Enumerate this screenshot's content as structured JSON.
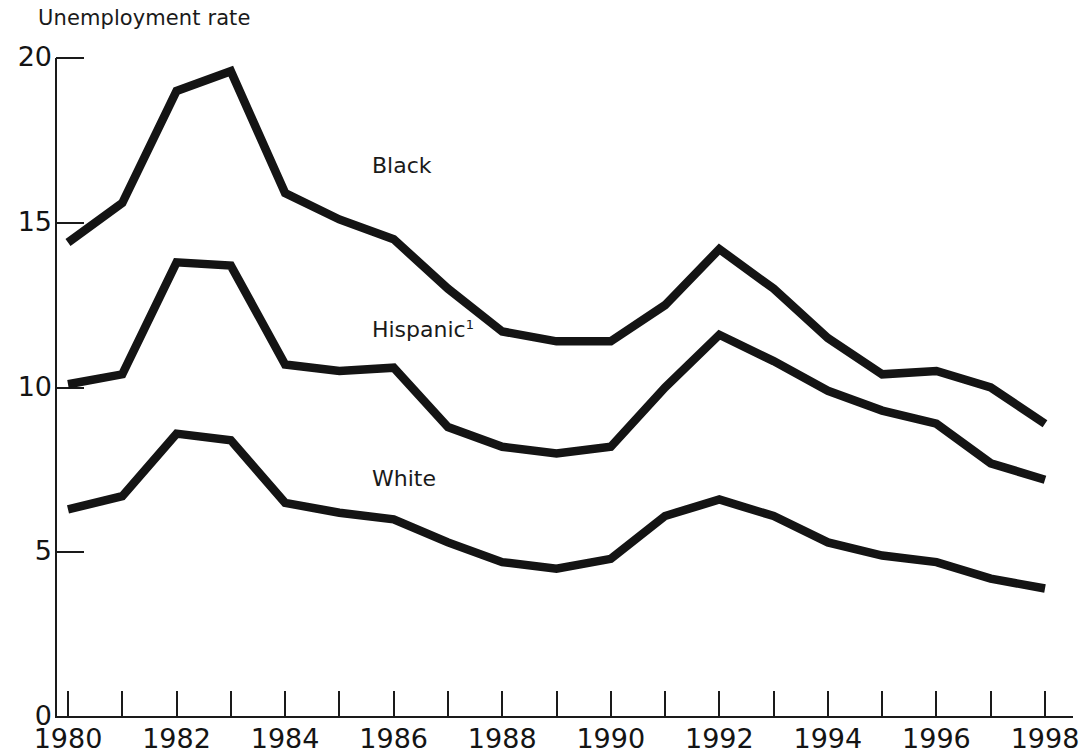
{
  "chart_data": {
    "type": "line",
    "title": "Unemployment rate",
    "xlabel": "",
    "ylabel": "",
    "xlim": [
      1980,
      1998
    ],
    "ylim": [
      0,
      20
    ],
    "yticks": [
      0,
      5,
      10,
      15,
      20
    ],
    "ytick_labels": [
      "0",
      "5",
      "10",
      "15",
      "20"
    ],
    "xticks": [
      1980,
      1981,
      1982,
      1983,
      1984,
      1985,
      1986,
      1987,
      1988,
      1989,
      1990,
      1991,
      1992,
      1993,
      1994,
      1995,
      1996,
      1997,
      1998
    ],
    "xtick_labels": [
      "1980",
      "",
      "1982",
      "",
      "1984",
      "",
      "1986",
      "",
      "1988",
      "",
      "1990",
      "",
      "1992",
      "",
      "1994",
      "",
      "1996",
      "",
      "1998"
    ],
    "labeled_xticks": [
      "1980",
      "1982",
      "1984",
      "1986",
      "1988",
      "1990",
      "1992",
      "1994",
      "1996",
      "1998"
    ],
    "grid": false,
    "legend_position": "inline-annotations",
    "x": [
      1980,
      1981,
      1982,
      1983,
      1984,
      1985,
      1986,
      1987,
      1988,
      1989,
      1990,
      1991,
      1992,
      1993,
      1994,
      1995,
      1996,
      1997,
      1998
    ],
    "series": [
      {
        "name": "Black",
        "label": "Black",
        "color": "#141414",
        "values": [
          14.4,
          15.6,
          19.0,
          19.6,
          15.9,
          15.1,
          14.5,
          13.0,
          11.7,
          11.4,
          11.4,
          12.5,
          14.2,
          13.0,
          11.5,
          10.4,
          10.5,
          10.0,
          8.9
        ]
      },
      {
        "name": "Hispanic",
        "label": "Hispanic",
        "label_superscript": "1",
        "color": "#141414",
        "values": [
          10.1,
          10.4,
          13.8,
          13.7,
          10.7,
          10.5,
          10.6,
          8.8,
          8.2,
          8.0,
          8.2,
          10.0,
          11.6,
          10.8,
          9.9,
          9.3,
          8.9,
          7.7,
          7.2
        ]
      },
      {
        "name": "White",
        "label": "White",
        "color": "#141414",
        "values": [
          6.3,
          6.7,
          8.6,
          8.4,
          6.5,
          6.2,
          6.0,
          5.3,
          4.7,
          4.5,
          4.8,
          6.1,
          6.6,
          6.1,
          5.3,
          4.9,
          4.7,
          4.2,
          3.9
        ]
      }
    ],
    "annotations": [
      {
        "text": "Black",
        "x": 1985.6,
        "y": 16.7
      },
      {
        "text": "Hispanic¹",
        "x": 1985.6,
        "y": 11.7
      },
      {
        "text": "White",
        "x": 1985.6,
        "y": 7.2
      }
    ]
  },
  "axes": {
    "y_axis_name": "unemployment-rate-axis",
    "x_axis_name": "year-axis"
  }
}
